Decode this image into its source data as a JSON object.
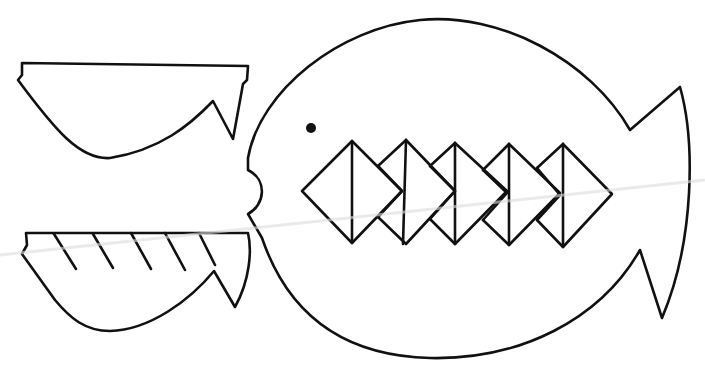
{
  "drawing": {
    "subject": "fish coloring template",
    "line_color": "#111111",
    "background": "#ffffff",
    "parts": [
      {
        "name": "upper-fin-cutout"
      },
      {
        "name": "lower-fin-cutout",
        "stripes": 5
      },
      {
        "name": "fish-body"
      },
      {
        "name": "eye"
      },
      {
        "name": "teeth-diamonds",
        "count": 5
      },
      {
        "name": "tail-fin"
      }
    ]
  }
}
